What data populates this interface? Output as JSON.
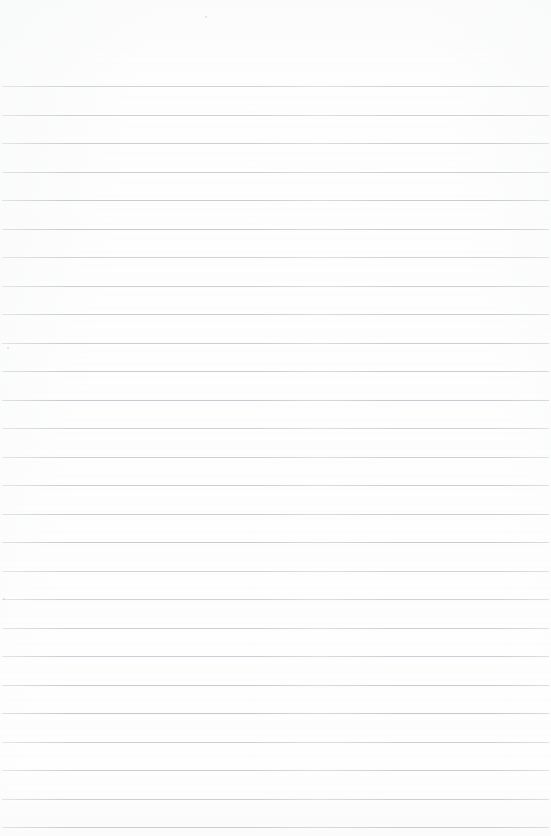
{
  "document": {
    "type": "scanned-lined-paper",
    "title": "Blank Ruled Notebook Page",
    "has_text_content": false,
    "has_handwriting": false,
    "has_margin_rule": false,
    "has_punch_holes": false,
    "body_text": "",
    "header_text": "",
    "footer_text": "",
    "page_number_text": ""
  },
  "canvas": {
    "width": 551,
    "height": 836
  },
  "colors": {
    "paper_background": "#fefefe",
    "rule_line": "#c6cace",
    "page_edge": "#f4f5f6"
  },
  "ruling": {
    "style": "wide-ruled-horizontal",
    "line_count": 27,
    "first_line_y": 86,
    "line_spacing": 28.5,
    "line_thickness": 1,
    "left_inset": 2,
    "right_inset": 2,
    "top_margin_height": 86,
    "line_y_positions": [
      86,
      114.5,
      143,
      171.5,
      200,
      228.5,
      257,
      285.5,
      314,
      342.5,
      371,
      399.5,
      428,
      456.5,
      485,
      513.5,
      542,
      570.5,
      599,
      627.5,
      656,
      684.5,
      713,
      741.5,
      770,
      798.5,
      827
    ]
  },
  "artifacts": {
    "specks": [
      {
        "x": 205,
        "y": 16
      },
      {
        "x": 7,
        "y": 347
      },
      {
        "x": 3,
        "y": 598
      }
    ]
  }
}
